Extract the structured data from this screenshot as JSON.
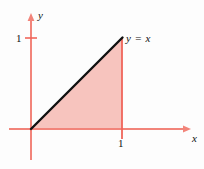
{
  "figure": {
    "kind": "math-diagram"
  },
  "axes": {
    "x_label": "x",
    "y_label": "y",
    "axis_color": "#f2847a",
    "origin": {
      "x": 31,
      "y": 129
    },
    "x_axis": {
      "start_x": 9,
      "end_x": 190,
      "y": 129,
      "arrow": true
    },
    "y_axis": {
      "x": 31,
      "start_y": 160,
      "end_y": 14,
      "arrow": true
    }
  },
  "ticks": {
    "x": [
      {
        "label": "1",
        "px_x": 122,
        "color": "#111111"
      }
    ],
    "y": [
      {
        "label": "1",
        "px_y": 38,
        "color": "#111111",
        "tick_color": "#f0655a"
      }
    ]
  },
  "curve": {
    "label": "y = x",
    "equation": "y = x",
    "color": "#111111",
    "width_px": 2.4,
    "from": {
      "x": 31,
      "y": 129
    },
    "to": {
      "x": 122,
      "y": 38
    }
  },
  "boundary_line": {
    "name": "vertical-line-x-equals-1",
    "color": "#f0655a",
    "x": 122,
    "top_y": 38,
    "bottom_y": 139
  },
  "shaded_region": {
    "name": "area-under-y-equals-x",
    "fill": "#f7c4be",
    "vertices": [
      {
        "x": 31,
        "y": 129
      },
      {
        "x": 122,
        "y": 38
      },
      {
        "x": 122,
        "y": 129
      }
    ]
  },
  "colors": {
    "background": "#fdfdfd",
    "axis": "#f2847a",
    "accent_line": "#f0655a",
    "region_fill": "#f7c4be",
    "curve": "#111111",
    "text": "#111111"
  }
}
